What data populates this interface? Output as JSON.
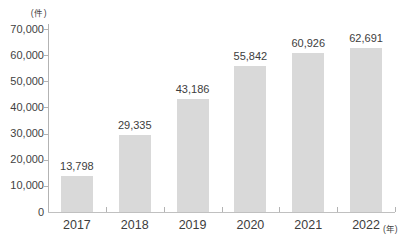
{
  "chart_data": {
    "type": "bar",
    "title": "",
    "categories": [
      "2017",
      "2018",
      "2019",
      "2020",
      "2021",
      "2022"
    ],
    "values": [
      13798,
      29335,
      43186,
      55842,
      60926,
      62691
    ],
    "value_labels": [
      "13,798",
      "29,335",
      "43,186",
      "55,842",
      "60,926",
      "62,691"
    ],
    "xlabel": "",
    "ylabel": "",
    "y_axis_unit": "(件)",
    "x_axis_unit": "(年)",
    "ylim": [
      0,
      70000
    ],
    "ytick_step": 10000,
    "ytick_labels": [
      "0",
      "10,000",
      "20,000",
      "30,000",
      "40,000",
      "50,000",
      "60,000",
      "70,000"
    ],
    "grid": false,
    "legend": "none",
    "bar_color": "#d9d9d9",
    "axis_color": "#b3b3b3",
    "text_color": "#3d3d3d",
    "background_color": "#ffffff"
  }
}
